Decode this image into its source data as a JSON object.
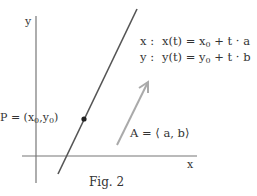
{
  "figure": {
    "caption": "Fig. 2",
    "axes": {
      "x_label": "x",
      "y_label": "y"
    },
    "point": {
      "label_prefix": "P = (x",
      "sub0": "0",
      "label_mid": ",y",
      "sub1": "0",
      "label_suffix": ")"
    },
    "vector": {
      "label": "A = ⟨ a, b⟩"
    },
    "equations": [
      {
        "lhs": "x :",
        "rhs_prefix": "x(t) = x",
        "sub": "0",
        "rhs_suffix": " + t · a"
      },
      {
        "lhs": "y :",
        "rhs_prefix": "y(t) = y",
        "sub": "0",
        "rhs_suffix": " + t · b"
      }
    ],
    "colors": {
      "axis": "#777777",
      "line": "#555555",
      "vector": "#aaaaaa",
      "point": "#222222",
      "text": "#333333"
    }
  }
}
